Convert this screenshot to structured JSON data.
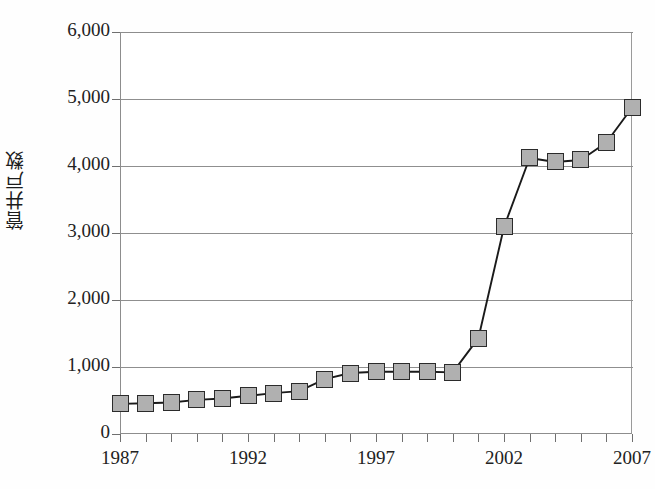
{
  "chart_data": {
    "type": "line",
    "title": "",
    "xlabel": "",
    "ylabel": "管井戸数",
    "xlim": [
      1987,
      2007
    ],
    "ylim": [
      0,
      6000
    ],
    "grid": true,
    "legend": "none",
    "marker": "filled-square",
    "y_ticks": [
      0,
      1000,
      2000,
      3000,
      4000,
      5000,
      6000
    ],
    "y_tick_labels": [
      "0",
      "1,000",
      "2,000",
      "3,000",
      "4,000",
      "5,000",
      "6,000"
    ],
    "x_tick_labels": [
      "1987",
      "1992",
      "1997",
      "2002",
      "2007"
    ],
    "x_tick_label_years": [
      1987,
      1992,
      1997,
      2002,
      2007
    ],
    "x_ticks_all_years": [
      1987,
      1988,
      1989,
      1990,
      1991,
      1992,
      1993,
      1994,
      1995,
      1996,
      1997,
      1998,
      1999,
      2000,
      2001,
      2002,
      2003,
      2004,
      2005,
      2006,
      2007
    ],
    "x": [
      1987,
      1988,
      1989,
      1990,
      1991,
      1992,
      1993,
      1994,
      1995,
      1996,
      1997,
      1998,
      1999,
      2000,
      2001,
      2002,
      2003,
      2004,
      2005,
      2006,
      2007
    ],
    "values": [
      450,
      460,
      470,
      510,
      530,
      570,
      610,
      640,
      820,
      910,
      930,
      930,
      930,
      920,
      1430,
      3090,
      4120,
      4060,
      4090,
      4350,
      4870
    ],
    "series": [
      {
        "name": "管井戸数",
        "values": [
          450,
          460,
          470,
          510,
          530,
          570,
          610,
          640,
          820,
          910,
          930,
          930,
          930,
          920,
          1430,
          3090,
          4120,
          4060,
          4090,
          4350,
          4870
        ]
      }
    ],
    "colors": {
      "line": "#1a1a1a",
      "marker_fill": "#b0b0b0",
      "marker_edge": "#2b2b2b",
      "grid": "#8f8f8f",
      "axis": "#8d8d8d",
      "text": "#222222"
    }
  }
}
